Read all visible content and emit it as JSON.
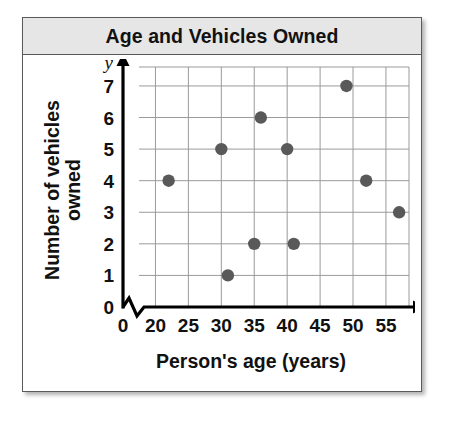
{
  "card": {
    "title": "Age and Vehicles Owned"
  },
  "chart_data": {
    "type": "scatter",
    "title": "Age and Vehicles Owned",
    "xlabel": "Person's age (years)",
    "ylabel": "Number of vehicles owned",
    "ylabel_lines": [
      "Number of vehicles",
      "owned"
    ],
    "x_axis_symbol": "x",
    "y_axis_symbol": "y",
    "x_origin_label": "0",
    "xticks": [
      20,
      25,
      30,
      35,
      40,
      45,
      50,
      55
    ],
    "xtick_labels": [
      "20",
      "25",
      "30",
      "35",
      "40",
      "45",
      "50",
      "55"
    ],
    "yticks": [
      0,
      1,
      2,
      3,
      4,
      5,
      6,
      7
    ],
    "ytick_labels": [
      "0",
      "1",
      "2",
      "3",
      "4",
      "5",
      "6",
      "7"
    ],
    "xlim": [
      17.5,
      58.5
    ],
    "ylim": [
      0,
      7.6
    ],
    "grid": true,
    "axis_break_x": true,
    "legend": "none",
    "point_color": "#595959",
    "grid_color": "#9a9a9a",
    "axis_color": "#000000",
    "points": [
      {
        "x": 22,
        "y": 4
      },
      {
        "x": 30,
        "y": 5
      },
      {
        "x": 31,
        "y": 1
      },
      {
        "x": 35,
        "y": 2
      },
      {
        "x": 36,
        "y": 6
      },
      {
        "x": 40,
        "y": 5
      },
      {
        "x": 41,
        "y": 2
      },
      {
        "x": 49,
        "y": 7
      },
      {
        "x": 52,
        "y": 4
      },
      {
        "x": 57,
        "y": 3
      }
    ]
  }
}
